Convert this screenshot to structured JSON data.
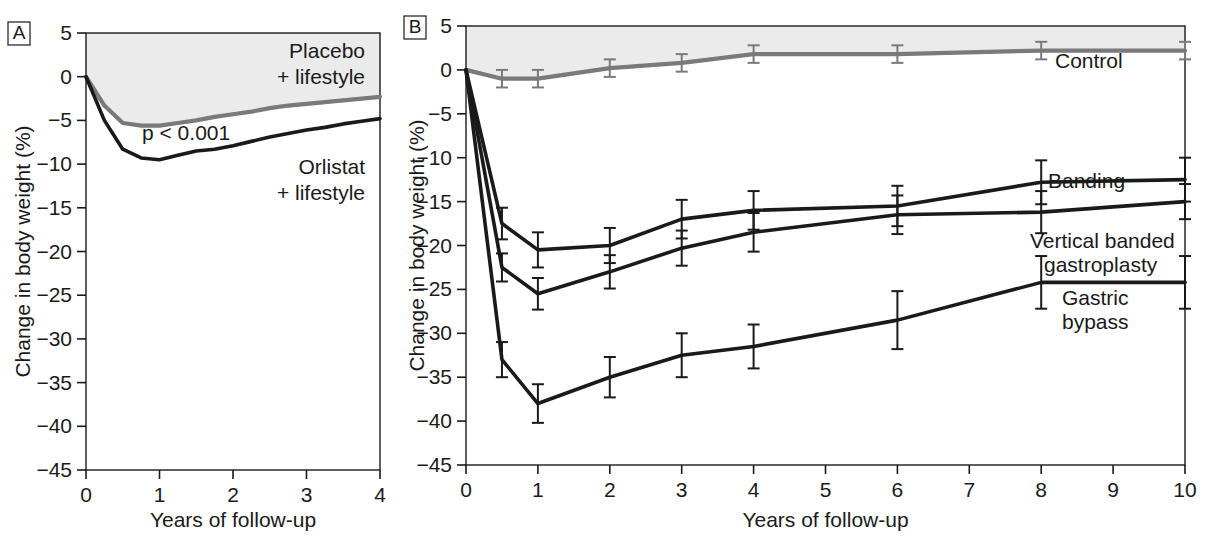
{
  "figure": {
    "background_color": "#ffffff",
    "shaded_band_color": "#ebebeb",
    "axis_color": "#1a1a1a",
    "dark_series_color": "#1a1a1a",
    "gray_series_color": "#7a7a7a"
  },
  "panels": [
    {
      "letter": "A",
      "xlabel": "Years of follow-up",
      "ylabel": "Change in body weight (%)",
      "annotation": "p < 0.001",
      "xticks": [
        "0",
        "1",
        "2",
        "3",
        "4"
      ],
      "yticks": [
        "5",
        "0",
        "−5",
        "−10",
        "−15",
        "−20",
        "−25",
        "−30",
        "−35",
        "−40",
        "−45"
      ],
      "labels": [
        {
          "name": "placebo",
          "line1": "Placebo",
          "line2": "+ lifestyle"
        },
        {
          "name": "orlistat",
          "line1": "Orlistat",
          "line2": "+ lifestyle"
        }
      ]
    },
    {
      "letter": "B",
      "xlabel": "Years of follow-up",
      "ylabel": "Change in body weight (%)",
      "xticks": [
        "0",
        "1",
        "2",
        "3",
        "4",
        "5",
        "6",
        "7",
        "8",
        "9",
        "10"
      ],
      "yticks": [
        "5",
        "0",
        "−5",
        "−10",
        "−15",
        "−20",
        "−25",
        "−30",
        "−35",
        "−40",
        "−45"
      ],
      "labels": [
        {
          "name": "control",
          "line1": "Control",
          "line2": ""
        },
        {
          "name": "banding",
          "line1": "Banding",
          "line2": ""
        },
        {
          "name": "vbg",
          "line1": "Vertical banded",
          "line2": "gastroplasty"
        },
        {
          "name": "gastric-bypass",
          "line1": "Gastric",
          "line2": "bypass"
        }
      ]
    }
  ],
  "chart_data": [
    {
      "type": "line",
      "panel": "A",
      "title": "",
      "xlabel": "Years of follow-up",
      "ylabel": "Change in body weight (%)",
      "xlim": [
        0,
        4
      ],
      "ylim": [
        -45,
        5
      ],
      "xticks": [
        0,
        1,
        2,
        3,
        4
      ],
      "yticks": [
        5,
        0,
        -5,
        -10,
        -15,
        -20,
        -25,
        -30,
        -35,
        -40,
        -45
      ],
      "grid": false,
      "legend": "inline-labels",
      "annotations": [
        {
          "text": "p < 0.001",
          "x": 0.85,
          "y": -7.0
        }
      ],
      "series": [
        {
          "name": "Placebo + lifestyle",
          "color": "#7a7a7a",
          "x": [
            0,
            0.25,
            0.5,
            0.75,
            1.0,
            1.25,
            1.5,
            1.75,
            2.0,
            2.25,
            2.5,
            2.75,
            3.0,
            3.25,
            3.5,
            3.75,
            4.0
          ],
          "y": [
            0,
            -3.3,
            -5.3,
            -5.6,
            -5.6,
            -5.3,
            -5.0,
            -4.6,
            -4.3,
            -4.0,
            -3.6,
            -3.3,
            -3.1,
            -2.9,
            -2.7,
            -2.5,
            -2.3
          ]
        },
        {
          "name": "Orlistat + lifestyle",
          "color": "#1a1a1a",
          "x": [
            0,
            0.25,
            0.5,
            0.75,
            1.0,
            1.25,
            1.5,
            1.75,
            2.0,
            2.25,
            2.5,
            2.75,
            3.0,
            3.25,
            3.5,
            3.75,
            4.0
          ],
          "y": [
            0,
            -5.0,
            -8.3,
            -9.3,
            -9.5,
            -9.0,
            -8.5,
            -8.3,
            -7.9,
            -7.4,
            -6.9,
            -6.5,
            -6.1,
            -5.8,
            -5.4,
            -5.1,
            -4.8
          ]
        }
      ]
    },
    {
      "type": "line",
      "panel": "B",
      "title": "",
      "xlabel": "Years of follow-up",
      "ylabel": "Change in body weight (%)",
      "xlim": [
        0,
        10
      ],
      "ylim": [
        -45,
        5
      ],
      "xticks": [
        0,
        1,
        2,
        3,
        4,
        5,
        6,
        7,
        8,
        9,
        10
      ],
      "yticks": [
        5,
        0,
        -5,
        -10,
        -15,
        -20,
        -25,
        -30,
        -35,
        -40,
        -45
      ],
      "grid": false,
      "legend": "inline-labels",
      "errorbars": true,
      "series": [
        {
          "name": "Control",
          "color": "#7a7a7a",
          "x": [
            0,
            0.5,
            1,
            2,
            3,
            4,
            6,
            8,
            10
          ],
          "y": [
            0,
            -1.0,
            -1.0,
            0.2,
            0.8,
            1.8,
            1.8,
            2.2,
            2.2
          ],
          "yerr": [
            0,
            1.0,
            1.0,
            1.0,
            1.0,
            1.0,
            1.0,
            1.0,
            1.0
          ]
        },
        {
          "name": "Banding",
          "color": "#1a1a1a",
          "x": [
            0,
            0.5,
            1,
            2,
            3,
            4,
            6,
            8,
            10
          ],
          "y": [
            0,
            -17.5,
            -20.5,
            -20.0,
            -17.0,
            -16.0,
            -15.5,
            -12.8,
            -12.5
          ],
          "yerr": [
            0,
            1.8,
            2.0,
            2.0,
            2.2,
            2.2,
            2.3,
            2.5,
            2.5
          ]
        },
        {
          "name": "Vertical banded gastroplasty",
          "color": "#1a1a1a",
          "x": [
            0,
            0.5,
            1,
            2,
            3,
            4,
            6,
            8,
            10
          ],
          "y": [
            0,
            -22.5,
            -25.5,
            -23.0,
            -20.3,
            -18.5,
            -16.5,
            -16.2,
            -15.0
          ],
          "yerr": [
            0,
            1.6,
            1.8,
            1.9,
            2.0,
            2.2,
            2.2,
            2.4,
            2.0
          ]
        },
        {
          "name": "Gastric bypass",
          "color": "#1a1a1a",
          "x": [
            0,
            0.5,
            1,
            2,
            3,
            4,
            6,
            8,
            10
          ],
          "y": [
            0,
            -33.0,
            -38.0,
            -35.0,
            -32.5,
            -31.5,
            -28.5,
            -24.2,
            -24.2
          ],
          "yerr": [
            0,
            2.0,
            2.2,
            2.3,
            2.5,
            2.5,
            3.3,
            3.0,
            3.0
          ]
        }
      ]
    }
  ]
}
